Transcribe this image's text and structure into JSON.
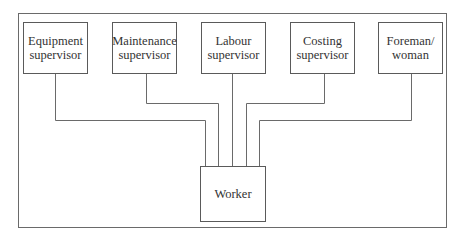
{
  "diagram": {
    "type": "organization-chart",
    "supervisors": [
      {
        "id": "equipment",
        "line1": "Equipment",
        "line2": "supervisor"
      },
      {
        "id": "maintenance",
        "line1": "Maintenance",
        "line2": "supervisor"
      },
      {
        "id": "labour",
        "line1": "Labour",
        "line2": "supervisor"
      },
      {
        "id": "costing",
        "line1": "Costing",
        "line2": "supervisor"
      },
      {
        "id": "foreman",
        "line1": "Foreman/",
        "line2": "woman"
      }
    ],
    "worker": {
      "label": "Worker"
    },
    "edges": [
      {
        "from": "equipment",
        "to": "worker"
      },
      {
        "from": "maintenance",
        "to": "worker"
      },
      {
        "from": "labour",
        "to": "worker"
      },
      {
        "from": "costing",
        "to": "worker"
      },
      {
        "from": "foreman",
        "to": "worker"
      }
    ]
  }
}
